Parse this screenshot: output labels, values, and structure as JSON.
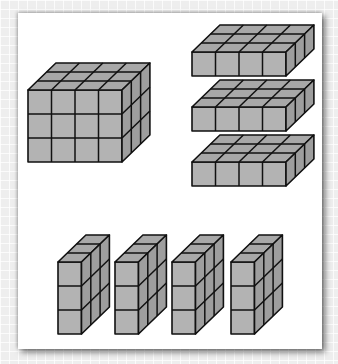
{
  "figure": {
    "colors": {
      "front": "#b3b3b3",
      "top": "#a8a8a8",
      "side": "#9e9e9e",
      "stroke": "#111111",
      "panel": "#ffffff",
      "background": "#eeeeee"
    },
    "cell": {
      "w": 23.5,
      "h": 24,
      "dx": 9.3,
      "dy": -9
    },
    "solids": [
      {
        "name": "full-box",
        "x": 28,
        "y": 90,
        "nx": 4,
        "ny": 3,
        "nz": 3
      },
      {
        "name": "layer-1",
        "x": 192,
        "y": 52,
        "nx": 4,
        "ny": 1,
        "nz": 3
      },
      {
        "name": "layer-2",
        "x": 192,
        "y": 107,
        "nx": 4,
        "ny": 1,
        "nz": 3
      },
      {
        "name": "layer-3",
        "x": 192,
        "y": 162,
        "nx": 4,
        "ny": 1,
        "nz": 3
      },
      {
        "name": "slice-1",
        "x": 58,
        "y": 262,
        "nx": 1,
        "ny": 3,
        "nz": 3
      },
      {
        "name": "slice-2",
        "x": 115,
        "y": 262,
        "nx": 1,
        "ny": 3,
        "nz": 3
      },
      {
        "name": "slice-3",
        "x": 172,
        "y": 262,
        "nx": 1,
        "ny": 3,
        "nz": 3
      },
      {
        "name": "slice-4",
        "x": 231,
        "y": 262,
        "nx": 1,
        "ny": 3,
        "nz": 3
      }
    ]
  }
}
